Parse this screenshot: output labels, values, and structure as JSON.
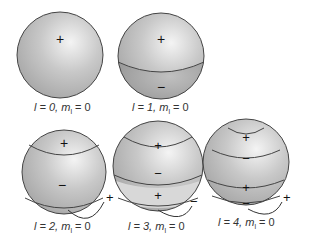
{
  "spheres": [
    {
      "l": "0",
      "ml": "0",
      "label_l": "l = 0,",
      "label_m": "m",
      "label_sub": "l",
      "label_eq": " = 0",
      "signs": [
        "+"
      ]
    },
    {
      "l": "1",
      "ml": "0",
      "label_l": "l = 1,",
      "label_m": "m",
      "label_sub": "l",
      "label_eq": " = 0",
      "signs": [
        "+",
        "−"
      ]
    },
    {
      "l": "2",
      "ml": "0",
      "label_l": "l = 2,",
      "label_m": "m",
      "label_sub": "l",
      "label_eq": " = 0",
      "signs": [
        "+",
        "−",
        "+"
      ]
    },
    {
      "l": "3",
      "ml": "0",
      "label_l": "l = 3,",
      "label_m": "m",
      "label_sub": "l",
      "label_eq": " = 0",
      "signs": [
        "+",
        "−",
        "+",
        "−"
      ]
    },
    {
      "l": "4",
      "ml": "0",
      "label_l": "l = 4,",
      "label_m": "m",
      "label_sub": "l",
      "label_eq": " = 0",
      "signs": [
        "+",
        "−",
        "+",
        "−",
        "+"
      ]
    }
  ]
}
